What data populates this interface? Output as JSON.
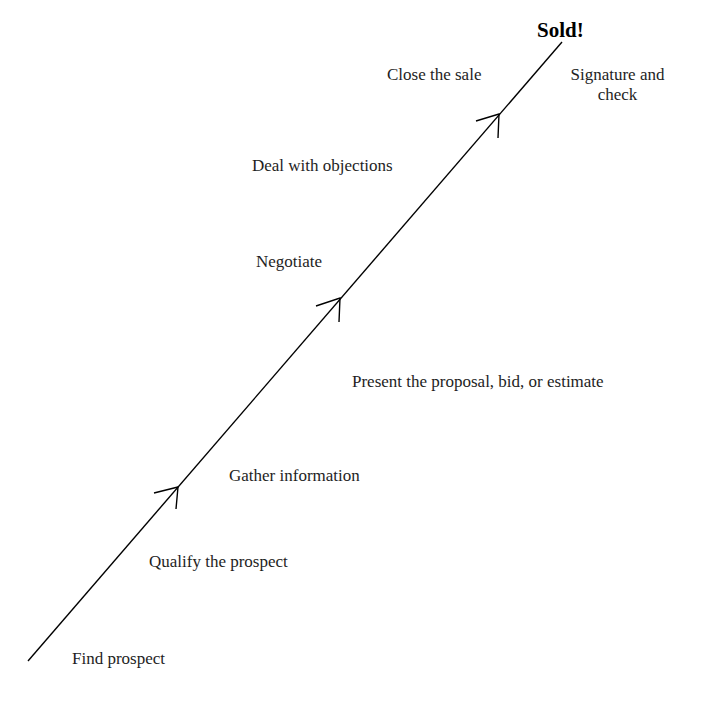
{
  "diagram": {
    "title": "Sold!",
    "steps": [
      {
        "label": "Find prospect"
      },
      {
        "label": "Qualify the prospect"
      },
      {
        "label": "Gather information"
      },
      {
        "label": "Present the proposal, bid, or estimate"
      },
      {
        "label": "Negotiate"
      },
      {
        "label": "Deal with objections"
      },
      {
        "label": "Close the sale"
      }
    ],
    "outcome": {
      "line1": "Signature and",
      "line2": "check"
    },
    "line_color": "#000000"
  }
}
